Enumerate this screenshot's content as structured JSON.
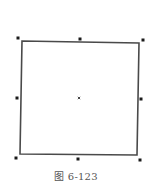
{
  "figure": {
    "caption": "图 6-123",
    "shape": "square",
    "stroke_color": "#4a4a4a",
    "handle_color": "#1a1a1a",
    "corners": [
      [
        22,
        41
      ],
      [
        139,
        43
      ],
      [
        137,
        155
      ],
      [
        20,
        154
      ]
    ],
    "handles": [
      {
        "name": "top-left",
        "x": 18,
        "y": 38
      },
      {
        "name": "top-middle",
        "x": 80,
        "y": 39
      },
      {
        "name": "top-right",
        "x": 143,
        "y": 40
      },
      {
        "name": "middle-left",
        "x": 17,
        "y": 98
      },
      {
        "name": "middle-right",
        "x": 141,
        "y": 99
      },
      {
        "name": "bottom-left",
        "x": 16,
        "y": 158
      },
      {
        "name": "bottom-middle",
        "x": 78,
        "y": 159
      },
      {
        "name": "bottom-right",
        "x": 140,
        "y": 160
      }
    ],
    "center_marker": {
      "icon": "x-center-icon",
      "x": 79,
      "y": 98
    }
  }
}
